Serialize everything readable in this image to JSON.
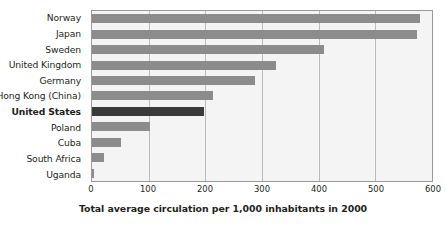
{
  "chart_data": {
    "type": "bar",
    "orientation": "horizontal",
    "title": "Total average circulation per 1,000 inhabitants in 2000",
    "xlabel": "",
    "ylabel": "",
    "xlim": [
      0,
      600
    ],
    "xticks": [
      0,
      100,
      200,
      300,
      400,
      500,
      600
    ],
    "xtick_labels": [
      "0",
      "100",
      "200",
      "300",
      "400",
      "500",
      "600"
    ],
    "grid": true,
    "legend": false,
    "categories": [
      "Norway",
      "Japan",
      "Sweden",
      "United Kingdom",
      "Germany",
      "Hong Kong (China)",
      "United States",
      "Poland",
      "Cuba",
      "South Africa",
      "Uganda"
    ],
    "values": [
      578,
      573,
      410,
      325,
      287,
      213,
      197,
      102,
      52,
      21,
      3
    ],
    "highlight_category": "United States",
    "colors": {
      "bar": "#8c8c8c",
      "bar_highlight": "#3a3a3a",
      "plot_background": "#f4f4f4",
      "gridline": "#b9b9b9",
      "axis_border": "#9a9a9a",
      "text": "#231f20"
    }
  }
}
